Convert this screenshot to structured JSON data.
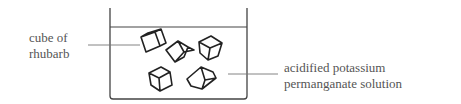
{
  "diagram": {
    "labels": {
      "cube": [
        "cube of",
        "rhubarb"
      ],
      "solution": [
        "acidified potassium",
        "permanganate solution"
      ]
    },
    "colors": {
      "line": "#333333",
      "label_line": "#777777",
      "text": "#555555"
    }
  }
}
